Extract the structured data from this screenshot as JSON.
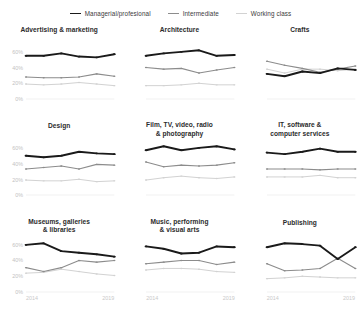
{
  "legend": {
    "items": [
      {
        "label": "Managerial/profesional",
        "color": "#1a1a1a",
        "width": 1.9
      },
      {
        "label": "Intermediate",
        "color": "#8c8c8c",
        "width": 1.1
      },
      {
        "label": "Working class",
        "color": "#d2d2d2",
        "width": 1.0
      }
    ]
  },
  "axis": {
    "yticks": [
      "60%",
      "40%",
      "20%",
      "0%"
    ],
    "xticks": [
      "2014",
      "2019"
    ]
  },
  "chart_data": {
    "type": "line",
    "title": "",
    "subtitle": "",
    "xlabel": "",
    "ylabel": "",
    "xlim": [
      2014,
      2019
    ],
    "ylim": [
      0,
      70
    ],
    "yticks": [
      0,
      20,
      40,
      60
    ],
    "xticks": [
      2014,
      2019
    ],
    "grid": false,
    "legend_position": "top-center",
    "x": [
      2014,
      2015,
      2016,
      2017,
      2018,
      2019
    ],
    "series_names": [
      "Managerial/profesional",
      "Intermediate",
      "Working class"
    ],
    "panels": [
      {
        "title": "Advertising & marketing",
        "title_lines": [
          "Advertising & marketing"
        ],
        "series": [
          {
            "name": "Managerial/profesional",
            "values": [
              55,
              55,
              58,
              54,
              53,
              57
            ]
          },
          {
            "name": "Intermediate",
            "values": [
              28,
              27,
              27,
              28,
              32,
              29
            ]
          },
          {
            "name": "Working class",
            "values": [
              19,
              18,
              19,
              21,
              19,
              17
            ]
          }
        ]
      },
      {
        "title": "Architecture",
        "title_lines": [
          "Architecture"
        ],
        "series": [
          {
            "name": "Managerial/profesional",
            "values": [
              55,
              58,
              60,
              62,
              55,
              56
            ]
          },
          {
            "name": "Intermediate",
            "values": [
              40,
              38,
              39,
              33,
              37,
              40
            ]
          },
          {
            "name": "Working class",
            "values": [
              17,
              17,
              18,
              20,
              18,
              18
            ]
          }
        ]
      },
      {
        "title": "Crafts",
        "title_lines": [
          "Crafts"
        ],
        "series": [
          {
            "name": "Managerial/profesional",
            "values": [
              32,
              29,
              35,
              33,
              39,
              37
            ]
          },
          {
            "name": "Intermediate",
            "values": [
              48,
              43,
              39,
              34,
              38,
              42
            ]
          },
          {
            "name": "Working class",
            "values": [
              38,
              33,
              38,
              38,
              36,
              38
            ]
          }
        ]
      },
      {
        "title": "Design",
        "title_lines": [
          "Design"
        ],
        "series": [
          {
            "name": "Managerial/profesional",
            "values": [
              50,
              48,
              50,
              55,
              53,
              52
            ]
          },
          {
            "name": "Intermediate",
            "values": [
              33,
              35,
              37,
              33,
              39,
              38
            ]
          },
          {
            "name": "Working class",
            "values": [
              19,
              18,
              18,
              20,
              17,
              18
            ]
          }
        ]
      },
      {
        "title": "Film, TV, video, radio & photography",
        "title_lines": [
          "Film, TV, video, radio",
          "& photography"
        ],
        "series": [
          {
            "name": "Managerial/profesional",
            "values": [
              57,
              62,
              57,
              60,
              62,
              58
            ]
          },
          {
            "name": "Intermediate",
            "values": [
              42,
              36,
              38,
              37,
              38,
              41
            ]
          },
          {
            "name": "Working class",
            "values": [
              19,
              22,
              24,
              22,
              21,
              23
            ]
          }
        ]
      },
      {
        "title": "IT, software & computer services",
        "title_lines": [
          "IT, software &",
          "computer services"
        ],
        "series": [
          {
            "name": "Managerial/profesional",
            "values": [
              54,
              52,
              55,
              59,
              55,
              55
            ]
          },
          {
            "name": "Intermediate",
            "values": [
              33,
              33,
              33,
              32,
              33,
              33
            ]
          },
          {
            "name": "Working class",
            "values": [
              23,
              23,
              23,
              25,
              22,
              22
            ]
          }
        ]
      },
      {
        "title": "Museums, galleries & libraries",
        "title_lines": [
          "Museums, galleries",
          "& libraries"
        ],
        "series": [
          {
            "name": "Managerial/profesional",
            "values": [
              60,
              62,
              52,
              50,
              48,
              45
            ]
          },
          {
            "name": "Intermediate",
            "values": [
              31,
              26,
              31,
              40,
              38,
              40
            ]
          },
          {
            "name": "Working class",
            "values": [
              24,
              25,
              29,
              26,
              23,
              21
            ]
          }
        ]
      },
      {
        "title": "Music, performing & visual arts",
        "title_lines": [
          "Music, performing",
          "& visual arts"
        ],
        "series": [
          {
            "name": "Managerial/profesional",
            "values": [
              58,
              55,
              49,
              50,
              58,
              57
            ]
          },
          {
            "name": "Intermediate",
            "values": [
              36,
              38,
              40,
              40,
              35,
              38
            ]
          },
          {
            "name": "Working class",
            "values": [
              28,
              30,
              30,
              29,
              26,
              25
            ]
          }
        ]
      },
      {
        "title": "Publishing",
        "title_lines": [
          "Publishing"
        ],
        "series": [
          {
            "name": "Managerial/profesional",
            "values": [
              57,
              62,
              61,
              59,
              42,
              57
            ]
          },
          {
            "name": "Intermediate",
            "values": [
              36,
              27,
              28,
              30,
              43,
              30
            ]
          },
          {
            "name": "Working class",
            "values": [
              17,
              18,
              20,
              19,
              18,
              18
            ]
          }
        ]
      }
    ]
  }
}
